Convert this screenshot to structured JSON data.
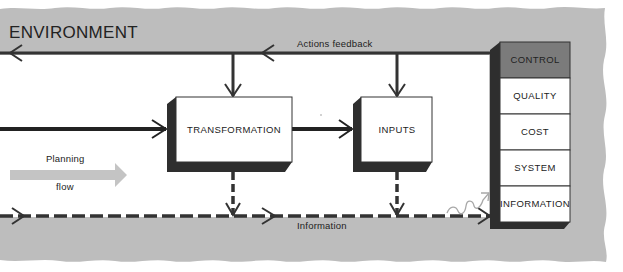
{
  "environment": {
    "title": "ENVIRONMENT",
    "band_color": "#bdbdbd"
  },
  "flows": {
    "actions_feedback_label": "Actions feedback",
    "information_label": "Information",
    "planning_flow_label_line1": "Planning",
    "planning_flow_label_line2": "flow"
  },
  "boxes": {
    "transformation": "TRANSFORMATION",
    "inputs": "INPUTS"
  },
  "control_stack": {
    "items": [
      {
        "label": "CONTROL",
        "highlighted": true
      },
      {
        "label": "QUALITY",
        "highlighted": false
      },
      {
        "label": "COST",
        "highlighted": false
      },
      {
        "label": "SYSTEM",
        "highlighted": false
      },
      {
        "label": "INFORMATION",
        "highlighted": false
      }
    ]
  },
  "colors": {
    "line": "#333333",
    "shadow": "#2e2e2e",
    "control_fill": "#7b7b7b",
    "planning_arrow": "#c4c4c4"
  }
}
